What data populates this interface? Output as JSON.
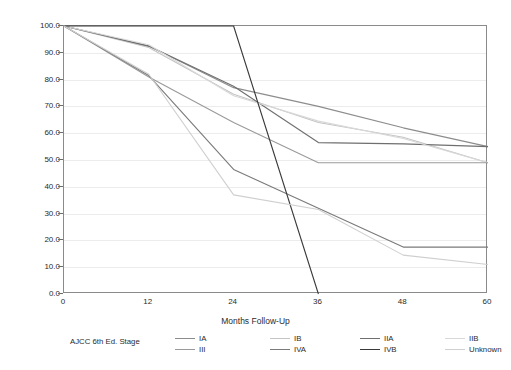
{
  "chart_data": {
    "type": "line",
    "title": "",
    "xlabel": "Months Follow-Up",
    "ylabel": "Survival Rate %",
    "x": [
      0,
      12,
      24,
      36,
      48,
      60
    ],
    "xlim": [
      0,
      60
    ],
    "ylim": [
      0,
      100
    ],
    "xticks": [
      "0",
      "12",
      "24",
      "36",
      "48",
      "60"
    ],
    "yticks": [
      "0.0",
      "10.0",
      "20.0",
      "30.0",
      "40.0",
      "50.0",
      "60.0",
      "70.0",
      "80.0",
      "90.0",
      "100.0"
    ],
    "grid": true,
    "legend_title": "AJCC 6th Ed. Stage",
    "legend_position": "bottom",
    "series": [
      {
        "name": "IA",
        "color": "#8c8c8c",
        "x": [
          0,
          12,
          24,
          36,
          48,
          60
        ],
        "values": [
          100.0,
          92.5,
          77.0,
          70.0,
          62.0,
          55.0
        ]
      },
      {
        "name": "IB",
        "color": "#c4c4c4",
        "x": [
          0,
          12,
          24,
          36,
          48,
          60
        ],
        "values": [
          100.0,
          92.0,
          74.5,
          64.0,
          58.5,
          49.0
        ]
      },
      {
        "name": "IIA",
        "color": "#6f6f6f",
        "x": [
          0,
          12,
          24,
          36,
          48,
          60
        ],
        "values": [
          100.0,
          92.5,
          77.5,
          56.5,
          56.0,
          55.0
        ]
      },
      {
        "name": "IIB",
        "color": "#d8d8d8",
        "x": [
          0,
          12,
          24,
          36,
          48,
          60
        ],
        "values": [
          100.0,
          93.0,
          74.0,
          64.5,
          58.0,
          49.0
        ]
      },
      {
        "name": "III",
        "color": "#9a9a9a",
        "x": [
          0,
          12,
          24,
          36,
          48,
          60
        ],
        "values": [
          100.0,
          81.0,
          64.0,
          49.0,
          49.0,
          49.0
        ]
      },
      {
        "name": "IVA",
        "color": "#7a7a7a",
        "x": [
          0,
          12,
          24,
          36,
          48,
          60
        ],
        "values": [
          100.0,
          81.5,
          46.5,
          32.0,
          17.5,
          17.5
        ]
      },
      {
        "name": "IVB",
        "color": "#3a3a3a",
        "x": [
          0,
          24,
          36
        ],
        "values": [
          100.0,
          100.0,
          0.0
        ]
      },
      {
        "name": "Unknown",
        "color": "#cfcfcf",
        "x": [
          0,
          12,
          24,
          36,
          48,
          60
        ],
        "values": [
          100.0,
          82.0,
          37.0,
          31.5,
          14.5,
          11.0
        ]
      }
    ]
  },
  "legend": {
    "title": "AJCC 6th Ed. Stage",
    "items": [
      {
        "label": "IA"
      },
      {
        "label": "IB"
      },
      {
        "label": "IIA"
      },
      {
        "label": "IIB"
      },
      {
        "label": "III"
      },
      {
        "label": "IVA"
      },
      {
        "label": "IVB"
      },
      {
        "label": "Unknown"
      }
    ]
  }
}
